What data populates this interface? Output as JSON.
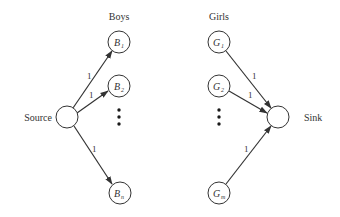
{
  "diagram": {
    "type": "bipartite-flow-network",
    "headers": {
      "boys": "Boys",
      "girls": "Girls"
    },
    "source": {
      "label": "Source"
    },
    "sink": {
      "label": "Sink"
    },
    "boys": [
      {
        "letter": "B",
        "sub": "1",
        "edge_capacity": "1"
      },
      {
        "letter": "B",
        "sub": "2",
        "edge_capacity": "1"
      },
      {
        "letter": "B",
        "sub": "n",
        "edge_capacity": "1"
      }
    ],
    "girls": [
      {
        "letter": "G",
        "sub": "1",
        "edge_capacity": "1"
      },
      {
        "letter": "G",
        "sub": "2",
        "edge_capacity": "1"
      },
      {
        "letter": "G",
        "sub": "m",
        "edge_capacity": "1"
      }
    ],
    "ellipsis": "vertical dots",
    "colors": {
      "stroke": "#333333",
      "background": "#ffffff"
    }
  }
}
